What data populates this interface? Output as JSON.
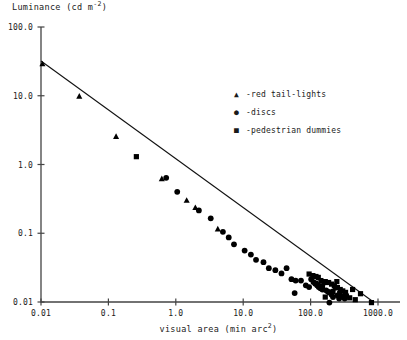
{
  "chart_data": {
    "type": "scatter",
    "title": "",
    "xlabel": "visual area (min arc",
    "xlabel_sup": "2",
    "xlabel_tail": ")",
    "ylabel": "Luminance (cd m",
    "ylabel_sup": "-2",
    "ylabel_tail": ")",
    "xscale": "log",
    "yscale": "log",
    "xlim": [
      0.01,
      1000.0
    ],
    "ylim": [
      0.01,
      100.0
    ],
    "grid": false,
    "xticks": [
      0.01,
      0.1,
      1.0,
      10.0,
      100.0,
      1000.0
    ],
    "xtick_labels": [
      "0.01",
      "0.1",
      "1.0",
      "10.0",
      "100.0",
      "1000.0"
    ],
    "yticks": [
      0.01,
      0.1,
      1.0,
      10.0,
      100.0
    ],
    "ytick_labels": [
      "0.01",
      "0.1",
      "1.0",
      "10.0",
      "100.0"
    ],
    "legend_position": "upper right",
    "legend": [
      {
        "marker": "triangle-marker",
        "glyph": "▲",
        "label": "-red tail-lights"
      },
      {
        "marker": "circle-marker",
        "glyph": "●",
        "label": "-discs"
      },
      {
        "marker": "square-marker",
        "glyph": "■",
        "label": "-pedestrian dummies"
      }
    ],
    "fit_line": {
      "label": "regression line",
      "x": [
        0.01,
        800.0
      ],
      "y": [
        32.0,
        0.0105
      ]
    },
    "series": [
      {
        "name": "red tail-lights",
        "marker": "triangle",
        "points": [
          [
            0.0105,
            29.0
          ],
          [
            0.037,
            9.8
          ],
          [
            0.13,
            2.55
          ],
          [
            0.62,
            0.62
          ],
          [
            1.45,
            0.3
          ],
          [
            1.95,
            0.235
          ],
          [
            4.2,
            0.115
          ]
        ]
      },
      {
        "name": "discs",
        "marker": "circle",
        "points": [
          [
            0.72,
            0.64
          ],
          [
            1.05,
            0.4
          ],
          [
            2.2,
            0.215
          ],
          [
            3.3,
            0.165
          ],
          [
            5.0,
            0.105
          ],
          [
            6.1,
            0.087
          ],
          [
            7.3,
            0.069
          ],
          [
            10.5,
            0.056
          ],
          [
            13.0,
            0.049
          ],
          [
            15.5,
            0.041
          ],
          [
            20.0,
            0.038
          ],
          [
            24.0,
            0.031
          ],
          [
            30.0,
            0.029
          ],
          [
            37.0,
            0.026
          ],
          [
            44.0,
            0.031
          ],
          [
            52.0,
            0.0215
          ],
          [
            60.0,
            0.0205
          ],
          [
            72.0,
            0.0205
          ],
          [
            85.0,
            0.0175
          ],
          [
            95.0,
            0.0165
          ],
          [
            102.0,
            0.0215
          ],
          [
            110.0,
            0.0195
          ],
          [
            118.0,
            0.0185
          ],
          [
            125.0,
            0.0175
          ],
          [
            132.0,
            0.0165
          ],
          [
            140.0,
            0.0158
          ],
          [
            150.0,
            0.0152
          ],
          [
            160.0,
            0.0192
          ],
          [
            170.0,
            0.0148
          ],
          [
            180.0,
            0.0142
          ],
          [
            190.0,
            0.0138
          ],
          [
            58.0,
            0.0135
          ],
          [
            205.0,
            0.0128
          ],
          [
            215.0,
            0.0118
          ],
          [
            235.0,
            0.0162
          ],
          [
            250.0,
            0.0125
          ],
          [
            265.0,
            0.0112
          ],
          [
            190.0,
            0.0098
          ],
          [
            300.0,
            0.0122
          ],
          [
            320.0,
            0.0112
          ]
        ]
      },
      {
        "name": "pedestrian dummies",
        "marker": "square",
        "points": [
          [
            0.26,
            1.3
          ],
          [
            95.0,
            0.0255
          ],
          [
            108.0,
            0.0242
          ],
          [
            120.0,
            0.0235
          ],
          [
            130.0,
            0.0228
          ],
          [
            118.0,
            0.0188
          ],
          [
            128.0,
            0.0178
          ],
          [
            142.0,
            0.0205
          ],
          [
            150.0,
            0.0172
          ],
          [
            165.0,
            0.0198
          ],
          [
            185.0,
            0.0192
          ],
          [
            205.0,
            0.0182
          ],
          [
            225.0,
            0.0172
          ],
          [
            250.0,
            0.0162
          ],
          [
            275.0,
            0.0152
          ],
          [
            300.0,
            0.0145
          ],
          [
            330.0,
            0.0138
          ],
          [
            245.0,
            0.0198
          ],
          [
            270.0,
            0.0132
          ],
          [
            300.0,
            0.0118
          ],
          [
            340.0,
            0.0122
          ],
          [
            380.0,
            0.0115
          ],
          [
            420.0,
            0.0152
          ],
          [
            460.0,
            0.0108
          ],
          [
            550.0,
            0.0132
          ],
          [
            800.0,
            0.0098
          ],
          [
            165.0,
            0.0118
          ],
          [
            215.0,
            0.0142
          ]
        ]
      }
    ]
  }
}
